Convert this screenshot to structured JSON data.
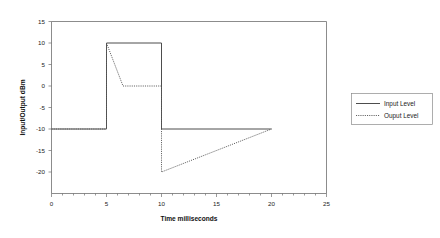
{
  "chart_data": {
    "type": "line",
    "title": "",
    "xlabel": "Time milliseconds",
    "ylabel": "Input/Output dBm",
    "xlim": [
      0,
      25
    ],
    "ylim": [
      -25,
      15
    ],
    "xticks": [
      "0",
      "5",
      "10",
      "15",
      "20",
      "25"
    ],
    "xtick_values": [
      0,
      5,
      10,
      15,
      20,
      25
    ],
    "yticks": [
      "15",
      "10",
      "5",
      "0",
      "-5",
      "-10",
      "-15",
      "-20"
    ],
    "ytick_values": [
      15,
      10,
      5,
      0,
      -5,
      -10,
      -15,
      -20
    ],
    "grid": false,
    "legend_position": "right",
    "series": [
      {
        "name": "Input Level",
        "style": "solid",
        "color": "#4d4d4d",
        "points": [
          [
            0,
            -10
          ],
          [
            5,
            -10
          ],
          [
            5,
            10
          ],
          [
            10,
            10
          ],
          [
            10,
            -10
          ],
          [
            20,
            -10
          ]
        ]
      },
      {
        "name": "Ouput Level",
        "style": "dotted",
        "color": "#5a5a5a",
        "points": [
          [
            0,
            -10
          ],
          [
            5,
            -10
          ],
          [
            5,
            10
          ],
          [
            6.5,
            0
          ],
          [
            10,
            0
          ],
          [
            10,
            -20
          ],
          [
            20,
            -10
          ]
        ]
      }
    ]
  },
  "legend": {
    "entries": [
      {
        "label": "Input Level",
        "style": "solid"
      },
      {
        "label": "Ouput Level",
        "style": "dotted"
      }
    ]
  },
  "axes": {
    "x_title": "Time milliseconds",
    "y_title": "Input/Output dBm"
  }
}
